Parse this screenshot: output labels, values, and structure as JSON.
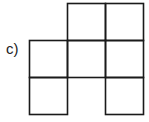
{
  "label": "c)",
  "grid": {
    "rows": 3,
    "cols": 3,
    "filled_cells": [
      [
        0,
        1
      ],
      [
        0,
        2
      ],
      [
        1,
        0
      ],
      [
        1,
        1
      ],
      [
        1,
        2
      ],
      [
        2,
        0
      ],
      [
        2,
        2
      ]
    ]
  }
}
